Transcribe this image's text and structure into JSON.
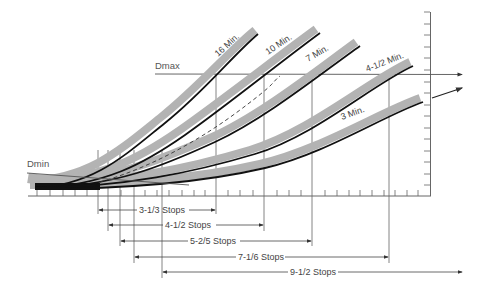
{
  "diagram": {
    "title": "",
    "labels": {
      "dmax": "Dmax",
      "dmin": "Dmin"
    },
    "curves": [
      {
        "label": "16 Min.",
        "band_color": "#b3b3b3",
        "line_color": "#111111"
      },
      {
        "label": "10 Min.",
        "band_color": "#b3b3b3",
        "line_color": "#111111"
      },
      {
        "label": "7 Min.",
        "band_color": "#b3b3b3",
        "line_color": "#111111"
      },
      {
        "label": "4-1/2 Min.",
        "band_color": "#b3b3b3",
        "line_color": "#111111"
      },
      {
        "label": "3 Min.",
        "band_color": "#b3b3b3",
        "line_color": "#111111"
      }
    ],
    "ranges": [
      {
        "label": "3-1/3 Stops"
      },
      {
        "label": "4-1/2 Stops"
      },
      {
        "label": "5-2/5 Stops"
      },
      {
        "label": "7-1/6 Stops"
      },
      {
        "label": "9-1/2 Stops"
      }
    ],
    "colors": {
      "background": "#ffffff",
      "axis": "#555555",
      "band": "#b3b3b3",
      "curve": "#111111"
    }
  }
}
